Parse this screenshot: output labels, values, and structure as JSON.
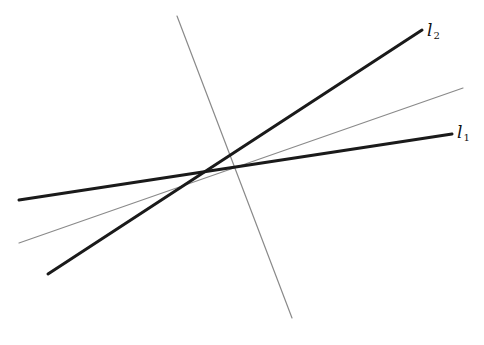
{
  "diagram": {
    "type": "intersecting-lines",
    "intersection": {
      "x": 236,
      "y": 167
    },
    "lines": [
      {
        "id": "l1",
        "label": "l",
        "subscript": "1",
        "style": "thick",
        "color": "#1a1a1a",
        "width": 3,
        "x1": 19,
        "y1": 200,
        "x2": 452,
        "y2": 134
      },
      {
        "id": "l2",
        "label": "l",
        "subscript": "2",
        "style": "thick",
        "color": "#1a1a1a",
        "width": 3,
        "x1": 48,
        "y1": 274,
        "x2": 422,
        "y2": 30
      },
      {
        "id": "bisector",
        "label": "",
        "style": "thin",
        "color": "#8a8a8a",
        "width": 1.2,
        "x1": 19,
        "y1": 243,
        "x2": 463,
        "y2": 88
      },
      {
        "id": "transversal",
        "label": "",
        "style": "thin",
        "color": "#8a8a8a",
        "width": 1.2,
        "x1": 177,
        "y1": 16,
        "x2": 292,
        "y2": 318
      }
    ],
    "labels": {
      "l1": {
        "main": "l",
        "sub": "1",
        "x": 457,
        "y": 124
      },
      "l2": {
        "main": "l",
        "sub": "2",
        "x": 427,
        "y": 22
      }
    }
  }
}
